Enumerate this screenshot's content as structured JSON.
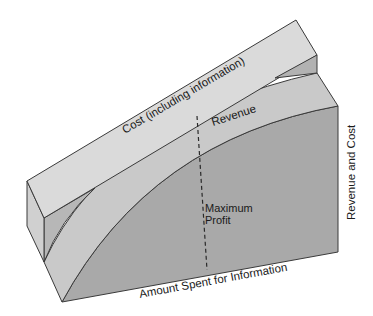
{
  "diagram": {
    "title": "",
    "labels": {
      "cost": "Cost (including information)",
      "revenue": "Revenue",
      "max_profit_line1": "Maximum",
      "max_profit_line2": "Profit",
      "x_axis": "Amount Spent for Information",
      "y_axis": "Revenue and Cost"
    },
    "colors": {
      "cost_top": "#d9d9d9",
      "cost_side": "#cfcfcf",
      "cost_end": "#b4b4b4",
      "revenue_band": "#c8c8c8",
      "revenue_face": "#a9a9a9",
      "left_wedge": "#b9b9b9",
      "outline": "#3a3a3a"
    }
  }
}
